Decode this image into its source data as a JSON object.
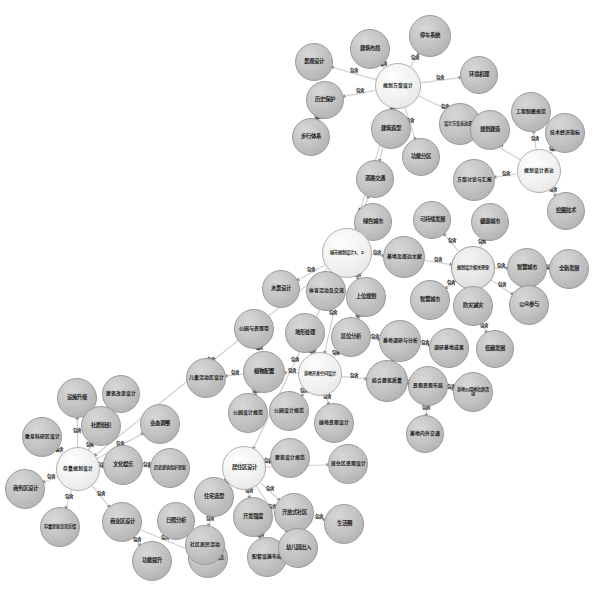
{
  "diagram": {
    "type": "force-directed-knowledge-graph",
    "background_color": "#ffffff",
    "node_fill": "#cfcfcf",
    "node_stroke": "#9a9a9a",
    "edge_color": "#d0d0d0",
    "edge_label_default": "包含",
    "nodes": [
      {
        "id": "n1",
        "label": "停车系统",
        "x": 430,
        "y": 36,
        "r": 21,
        "shade": "dark"
      },
      {
        "id": "n2",
        "label": "建筑布局",
        "x": 370,
        "y": 49,
        "r": 20,
        "shade": "dark"
      },
      {
        "id": "n3",
        "label": "景观设计",
        "x": 314,
        "y": 62,
        "r": 19,
        "shade": "dark"
      },
      {
        "id": "n4",
        "label": "规划方案设计",
        "x": 398,
        "y": 86,
        "r": 23,
        "shade": "hub"
      },
      {
        "id": "n5",
        "label": "环境机理",
        "x": 479,
        "y": 75,
        "r": 19,
        "shade": "dark"
      },
      {
        "id": "n6",
        "label": "历史保护",
        "x": 325,
        "y": 100,
        "r": 19,
        "shade": "dark"
      },
      {
        "id": "n7",
        "label": "工程制图规范",
        "x": 531,
        "y": 112,
        "r": 20,
        "shade": "dark"
      },
      {
        "id": "n8",
        "label": "设计方案表达逻辑",
        "x": 460,
        "y": 124,
        "r": 21,
        "shade": "dark"
      },
      {
        "id": "n9",
        "label": "建筑造型",
        "x": 391,
        "y": 129,
        "r": 20,
        "shade": "dark"
      },
      {
        "id": "n10",
        "label": "规划建造",
        "x": 490,
        "y": 130,
        "r": 20,
        "shade": "dark"
      },
      {
        "id": "n11",
        "label": "技术经济指标",
        "x": 565,
        "y": 133,
        "r": 20,
        "shade": "dark"
      },
      {
        "id": "n12",
        "label": "步行体系",
        "x": 311,
        "y": 137,
        "r": 19,
        "shade": "dark"
      },
      {
        "id": "n13",
        "label": "功能分区",
        "x": 421,
        "y": 157,
        "r": 19,
        "shade": "dark"
      },
      {
        "id": "n14",
        "label": "规划设计表达",
        "x": 539,
        "y": 171,
        "r": 22,
        "shade": "hub"
      },
      {
        "id": "n15",
        "label": "方案讨论与汇报",
        "x": 474,
        "y": 180,
        "r": 21,
        "shade": "dark"
      },
      {
        "id": "n16",
        "label": "道路交通",
        "x": 375,
        "y": 179,
        "r": 19,
        "shade": "dark"
      },
      {
        "id": "n17",
        "label": "绘图技术",
        "x": 566,
        "y": 211,
        "r": 19,
        "shade": "dark"
      },
      {
        "id": "n18",
        "label": "可持续发展",
        "x": 432,
        "y": 220,
        "r": 19,
        "shade": "dark"
      },
      {
        "id": "n19",
        "label": "绿色城市",
        "x": 373,
        "y": 222,
        "r": 19,
        "shade": "dark"
      },
      {
        "id": "n20",
        "label": "健康城市",
        "x": 490,
        "y": 222,
        "r": 19,
        "shade": "dark"
      },
      {
        "id": "n21",
        "label": "城市规划设计1、2",
        "x": 347,
        "y": 253,
        "r": 25,
        "shade": "hub"
      },
      {
        "id": "n22",
        "label": "基地及周边文献",
        "x": 404,
        "y": 257,
        "r": 21,
        "shade": "dark"
      },
      {
        "id": "n23",
        "label": "规划设计相关理论",
        "x": 473,
        "y": 268,
        "r": 22,
        "shade": "light"
      },
      {
        "id": "n24",
        "label": "智慧城市",
        "x": 527,
        "y": 268,
        "r": 20,
        "shade": "dark"
      },
      {
        "id": "n25",
        "label": "全新发展",
        "x": 569,
        "y": 269,
        "r": 20,
        "shade": "dark"
      },
      {
        "id": "n26",
        "label": "水景设计",
        "x": 281,
        "y": 289,
        "r": 19,
        "shade": "dark"
      },
      {
        "id": "n27",
        "label": "体育活动及交流",
        "x": 326,
        "y": 291,
        "r": 20,
        "shade": "dark"
      },
      {
        "id": "n28",
        "label": "上位规划",
        "x": 366,
        "y": 297,
        "r": 20,
        "shade": "dark"
      },
      {
        "id": "n29",
        "label": "智慧城市",
        "x": 430,
        "y": 300,
        "r": 20,
        "shade": "dark"
      },
      {
        "id": "n30",
        "label": "防灾减灾",
        "x": 473,
        "y": 306,
        "r": 20,
        "shade": "dark"
      },
      {
        "id": "n31",
        "label": "公众参与",
        "x": 529,
        "y": 305,
        "r": 20,
        "shade": "dark"
      },
      {
        "id": "n32",
        "label": "公园与景观带",
        "x": 254,
        "y": 329,
        "r": 20,
        "shade": "dark"
      },
      {
        "id": "n33",
        "label": "地形处理",
        "x": 305,
        "y": 333,
        "r": 20,
        "shade": "dark"
      },
      {
        "id": "n34",
        "label": "区位分析",
        "x": 351,
        "y": 337,
        "r": 20,
        "shade": "dark"
      },
      {
        "id": "n35",
        "label": "基地调研与分析",
        "x": 400,
        "y": 341,
        "r": 21,
        "shade": "dark"
      },
      {
        "id": "n36",
        "label": "调研基地成果",
        "x": 449,
        "y": 348,
        "r": 20,
        "shade": "dark"
      },
      {
        "id": "n37",
        "label": "低碳发展",
        "x": 495,
        "y": 349,
        "r": 19,
        "shade": "dark"
      },
      {
        "id": "n38",
        "label": "儿童活动区设计",
        "x": 206,
        "y": 378,
        "r": 20,
        "shade": "dark"
      },
      {
        "id": "n39",
        "label": "植物配置",
        "x": 264,
        "y": 372,
        "r": 21,
        "shade": "dark"
      },
      {
        "id": "n40",
        "label": "基地开发空间设计",
        "x": 320,
        "y": 374,
        "r": 22,
        "shade": "hub"
      },
      {
        "id": "n41",
        "label": "综合建筑质量",
        "x": 387,
        "y": 381,
        "r": 21,
        "shade": "dark"
      },
      {
        "id": "n42",
        "label": "景观景观布局",
        "x": 428,
        "y": 386,
        "r": 20,
        "shade": "dark"
      },
      {
        "id": "n43",
        "label": "基地公用地社群活动",
        "x": 473,
        "y": 392,
        "r": 20,
        "shade": "dark"
      },
      {
        "id": "n44",
        "label": "设施升级",
        "x": 77,
        "y": 398,
        "r": 20,
        "shade": "dark"
      },
      {
        "id": "n45",
        "label": "建筑改造设计",
        "x": 121,
        "y": 394,
        "r": 19,
        "shade": "dark"
      },
      {
        "id": "n46",
        "label": "社群组织",
        "x": 101,
        "y": 426,
        "r": 20,
        "shade": "dark"
      },
      {
        "id": "n47",
        "label": "业态调整",
        "x": 160,
        "y": 424,
        "r": 20,
        "shade": "dark"
      },
      {
        "id": "n48",
        "label": "教育科研区设计",
        "x": 42,
        "y": 437,
        "r": 20,
        "shade": "dark"
      },
      {
        "id": "n49",
        "label": "公园设计规范",
        "x": 248,
        "y": 413,
        "r": 20,
        "shade": "dark"
      },
      {
        "id": "n50",
        "label": "公园设计规范",
        "x": 289,
        "y": 411,
        "r": 20,
        "shade": "dark"
      },
      {
        "id": "n51",
        "label": "绿地景观设计",
        "x": 334,
        "y": 423,
        "r": 20,
        "shade": "dark"
      },
      {
        "id": "n52",
        "label": "基地内外交通",
        "x": 425,
        "y": 434,
        "r": 19,
        "shade": "dark"
      },
      {
        "id": "n53",
        "label": "存量规划设计",
        "x": 78,
        "y": 469,
        "r": 22,
        "shade": "hub"
      },
      {
        "id": "n54",
        "label": "文化娱乐",
        "x": 123,
        "y": 465,
        "r": 20,
        "shade": "dark"
      },
      {
        "id": "n55",
        "label": "历史建筑保护更新",
        "x": 170,
        "y": 468,
        "r": 20,
        "shade": "dark"
      },
      {
        "id": "n56",
        "label": "商务区设计",
        "x": 25,
        "y": 489,
        "r": 20,
        "shade": "dark"
      },
      {
        "id": "n57",
        "label": "居住区设计",
        "x": 244,
        "y": 468,
        "r": 22,
        "shade": "hub"
      },
      {
        "id": "n58",
        "label": "建筑设计规范",
        "x": 290,
        "y": 458,
        "r": 20,
        "shade": "dark"
      },
      {
        "id": "n59",
        "label": "居住区景观设计",
        "x": 348,
        "y": 464,
        "r": 20,
        "shade": "dark"
      },
      {
        "id": "n60",
        "label": "住宅选型",
        "x": 214,
        "y": 497,
        "r": 20,
        "shade": "dark"
      },
      {
        "id": "n61",
        "label": "存量更新意见反馈",
        "x": 60,
        "y": 527,
        "r": 20,
        "shade": "dark"
      },
      {
        "id": "n62",
        "label": "商业区设计",
        "x": 122,
        "y": 522,
        "r": 20,
        "shade": "dark"
      },
      {
        "id": "n63",
        "label": "日照分析",
        "x": 176,
        "y": 521,
        "r": 19,
        "shade": "dark"
      },
      {
        "id": "n64",
        "label": "开发强度",
        "x": 253,
        "y": 517,
        "r": 20,
        "shade": "dark"
      },
      {
        "id": "n65",
        "label": "开放式社区",
        "x": 294,
        "y": 513,
        "r": 20,
        "shade": "dark"
      },
      {
        "id": "n66",
        "label": "生活圈",
        "x": 344,
        "y": 524,
        "r": 20,
        "shade": "dark"
      },
      {
        "id": "n67",
        "label": "功能提升",
        "x": 152,
        "y": 561,
        "r": 20,
        "shade": "dark"
      },
      {
        "id": "n68",
        "label": "旧工业区更新改造",
        "x": 208,
        "y": 558,
        "r": 20,
        "shade": "dark"
      },
      {
        "id": "n69",
        "label": "社区居民活动",
        "x": 205,
        "y": 545,
        "r": 20,
        "shade": "dark"
      },
      {
        "id": "n70",
        "label": "配套设施布局",
        "x": 267,
        "y": 557,
        "r": 20,
        "shade": "dark"
      },
      {
        "id": "n71",
        "label": "幼儿园出入",
        "x": 298,
        "y": 548,
        "r": 20,
        "shade": "dark"
      }
    ],
    "edges": [
      {
        "source": "n4",
        "target": "n1",
        "label": "包含"
      },
      {
        "source": "n4",
        "target": "n2",
        "label": "包含"
      },
      {
        "source": "n4",
        "target": "n3",
        "label": "包含"
      },
      {
        "source": "n4",
        "target": "n5",
        "label": "包含"
      },
      {
        "source": "n4",
        "target": "n6",
        "label": "包含"
      },
      {
        "source": "n4",
        "target": "n9",
        "label": "包含"
      },
      {
        "source": "n4",
        "target": "n10",
        "label": "包含"
      },
      {
        "source": "n4",
        "target": "n13",
        "label": "包含"
      },
      {
        "source": "n4",
        "target": "n16",
        "label": "包含"
      },
      {
        "source": "n6",
        "target": "n12",
        "label": "包含"
      },
      {
        "source": "n14",
        "target": "n7",
        "label": "包含"
      },
      {
        "source": "n14",
        "target": "n8",
        "label": "包含"
      },
      {
        "source": "n14",
        "target": "n11",
        "label": "包含"
      },
      {
        "source": "n14",
        "target": "n15",
        "label": "包含"
      },
      {
        "source": "n14",
        "target": "n17",
        "label": "包含"
      },
      {
        "source": "n21",
        "target": "n4",
        "label": "包含"
      },
      {
        "source": "n21",
        "target": "n16",
        "label": "包含"
      },
      {
        "source": "n21",
        "target": "n19",
        "label": "包含"
      },
      {
        "source": "n21",
        "target": "n22",
        "label": "包含"
      },
      {
        "source": "n21",
        "target": "n26",
        "label": "包含"
      },
      {
        "source": "n21",
        "target": "n27",
        "label": "包含"
      },
      {
        "source": "n21",
        "target": "n28",
        "label": "包含"
      },
      {
        "source": "n21",
        "target": "n40",
        "label": "包含"
      },
      {
        "source": "n21",
        "target": "n57",
        "label": "包含"
      },
      {
        "source": "n21",
        "target": "n53",
        "label": "包含"
      },
      {
        "source": "n22",
        "target": "n23",
        "label": "包含"
      },
      {
        "source": "n23",
        "target": "n18",
        "label": "包含"
      },
      {
        "source": "n23",
        "target": "n20",
        "label": "包含"
      },
      {
        "source": "n23",
        "target": "n24",
        "label": "包含"
      },
      {
        "source": "n23",
        "target": "n29",
        "label": "包含"
      },
      {
        "source": "n23",
        "target": "n30",
        "label": "包含"
      },
      {
        "source": "n23",
        "target": "n31",
        "label": "包含"
      },
      {
        "source": "n24",
        "target": "n25",
        "label": "包含"
      },
      {
        "source": "n30",
        "target": "n37",
        "label": "包含"
      },
      {
        "source": "n28",
        "target": "n34",
        "label": "包含"
      },
      {
        "source": "n34",
        "target": "n35",
        "label": "包含"
      },
      {
        "source": "n35",
        "target": "n36",
        "label": "包含"
      },
      {
        "source": "n35",
        "target": "n41",
        "label": "包含"
      },
      {
        "source": "n40",
        "target": "n33",
        "label": "包含"
      },
      {
        "source": "n40",
        "target": "n34",
        "label": "包含"
      },
      {
        "source": "n40",
        "target": "n39",
        "label": "包含"
      },
      {
        "source": "n40",
        "target": "n41",
        "label": "包含"
      },
      {
        "source": "n40",
        "target": "n50",
        "label": "包含"
      },
      {
        "source": "n40",
        "target": "n51",
        "label": "包含"
      },
      {
        "source": "n39",
        "target": "n32",
        "label": "包含"
      },
      {
        "source": "n39",
        "target": "n38",
        "label": "包含"
      },
      {
        "source": "n39",
        "target": "n49",
        "label": "包含"
      },
      {
        "source": "n41",
        "target": "n42",
        "label": "包含"
      },
      {
        "source": "n42",
        "target": "n43",
        "label": "包含"
      },
      {
        "source": "n42",
        "target": "n52",
        "label": "包含"
      },
      {
        "source": "n53",
        "target": "n44",
        "label": "包含"
      },
      {
        "source": "n53",
        "target": "n45",
        "label": "包含"
      },
      {
        "source": "n53",
        "target": "n46",
        "label": "包含"
      },
      {
        "source": "n53",
        "target": "n47",
        "label": "包含"
      },
      {
        "source": "n53",
        "target": "n48",
        "label": "包含"
      },
      {
        "source": "n53",
        "target": "n54",
        "label": "包含"
      },
      {
        "source": "n53",
        "target": "n56",
        "label": "包含"
      },
      {
        "source": "n53",
        "target": "n61",
        "label": "包含"
      },
      {
        "source": "n53",
        "target": "n62",
        "label": "包含"
      },
      {
        "source": "n54",
        "target": "n55",
        "label": "包含"
      },
      {
        "source": "n62",
        "target": "n67",
        "label": "包含"
      },
      {
        "source": "n62",
        "target": "n68",
        "label": "包含"
      },
      {
        "source": "n57",
        "target": "n58",
        "label": "包含"
      },
      {
        "source": "n57",
        "target": "n59",
        "label": "包含"
      },
      {
        "source": "n57",
        "target": "n60",
        "label": "包含"
      },
      {
        "source": "n57",
        "target": "n64",
        "label": "包含"
      },
      {
        "source": "n57",
        "target": "n65",
        "label": "包含"
      },
      {
        "source": "n57",
        "target": "n71",
        "label": "包含"
      },
      {
        "source": "n60",
        "target": "n69",
        "label": "包含"
      },
      {
        "source": "n64",
        "target": "n70",
        "label": "包含"
      },
      {
        "source": "n65",
        "target": "n66",
        "label": "包含"
      }
    ]
  }
}
